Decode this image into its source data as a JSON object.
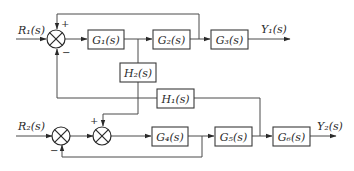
{
  "diagram": {
    "type": "control-system-block-diagram",
    "inputs": [
      {
        "id": "R1",
        "label": "R₁(s)"
      },
      {
        "id": "R2",
        "label": "R₂(s)"
      }
    ],
    "outputs": [
      {
        "id": "Y1",
        "label": "Y₁(s)"
      },
      {
        "id": "Y2",
        "label": "Y₂(s)"
      }
    ],
    "blocks": [
      {
        "id": "G1",
        "label": "G₁(s)"
      },
      {
        "id": "G2",
        "label": "G₂(s)"
      },
      {
        "id": "G3",
        "label": "G₃(s)"
      },
      {
        "id": "G4",
        "label": "G₄(s)"
      },
      {
        "id": "G5",
        "label": "G₅(s)"
      },
      {
        "id": "G6",
        "label": "G₆(s)"
      },
      {
        "id": "H1",
        "label": "H₁(s)"
      },
      {
        "id": "H2",
        "label": "H₂(s)"
      }
    ],
    "summing_junctions": [
      {
        "id": "S1",
        "signs": {
          "top": "+",
          "bottom": "−"
        }
      },
      {
        "id": "S2",
        "signs": {
          "bottom": "−"
        }
      },
      {
        "id": "S3",
        "signs": {
          "top": "+"
        }
      }
    ],
    "connections": [
      "R1 -> S1",
      "S1 -> G1",
      "G1 -> G2",
      "G2 -> G3",
      "G3 -> Y1",
      "G2 output -> S1 (+, top feedback)",
      "G1 output -> H2 -> S3 (+)",
      "G5 output -> H1 -> S1 (−)",
      "R2 -> S2",
      "S2 -> S3",
      "S3 -> G4",
      "G4 -> G5",
      "G4 output -> S2 (−, feedback)",
      "G5 -> G6",
      "G6 -> Y2"
    ]
  }
}
